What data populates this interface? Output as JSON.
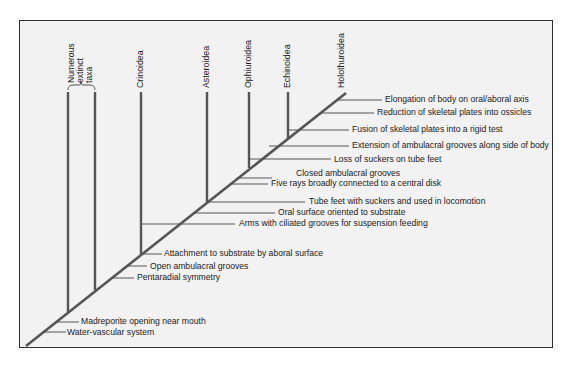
{
  "diagram": {
    "type": "cladogram",
    "title": "",
    "colors": {
      "frame_bg": "#f2f2f2",
      "line": "#555555",
      "border": "#2e2e2e",
      "text": "#1a1a1a"
    },
    "taxa": [
      {
        "id": "extinct",
        "label_lines": [
          "Numerous",
          "extinct",
          "taxa"
        ]
      },
      {
        "id": "crinoidea",
        "label": "Crinoidea"
      },
      {
        "id": "asteroidea",
        "label": "Asteroidea"
      },
      {
        "id": "ophiuroidea",
        "label": "Ophiuroidea"
      },
      {
        "id": "echinoidea",
        "label": "Echinoidea"
      },
      {
        "id": "holothuroidea",
        "label": "Holothuroidea"
      }
    ],
    "characters": [
      "Water-vascular system",
      "Madreporite opening near mouth",
      "Pentaradial symmetry",
      "Open ambulacral grooves",
      "Attachment to substrate by aboral surface",
      "Arms with ciliated grooves for suspension feeding",
      "Oral surface oriented to substrate",
      "Tube feet with suckers and used in locomotion",
      "Five rays broadly connected to a central disk",
      "Closed ambulacral grooves",
      "Loss of suckers on tube feet",
      "Extension of ambulacral grooves along side of body",
      "Fusion of skeletal plates into a rigid test",
      "Reduction of skeletal plates into ossicles",
      "Elongation of body on oral/aboral axis"
    ]
  }
}
